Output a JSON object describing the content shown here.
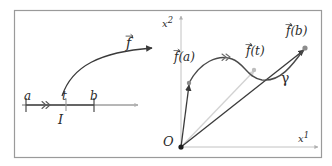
{
  "figure": {
    "frame": {
      "border_color": "#9a9a9a",
      "background": "#ffffff"
    },
    "colors": {
      "curve": "#3a3a3a",
      "axis": "#b9b9b9",
      "vector": "#3a3a3a",
      "faint_vector": "#cfcfcf",
      "point": "#8c8c8c",
      "text": "#2b2b2b"
    },
    "left_panel": {
      "name": "domain-interval",
      "interval_label": "I",
      "endpoint_left_label": "a",
      "interior_point_label": "t",
      "endpoint_right_label": "b",
      "map_label": "f",
      "map_label_has_vector_arrow": true,
      "number_line": {
        "y": 105,
        "x_start": 22,
        "x_end": 140,
        "ticks": [
          {
            "label": "a",
            "x": 26
          },
          {
            "label": "t",
            "x": 66
          },
          {
            "label": "b",
            "x": 94
          }
        ],
        "direction_marker_x": 46,
        "direction_marker_symbol": "double-chevron-right"
      }
    },
    "right_panel": {
      "name": "image-curve-plane",
      "axis_vertical_label": "x",
      "axis_vertical_sup": "2",
      "axis_horizontal_label": "x",
      "axis_horizontal_sup": "1",
      "origin_label": "O",
      "curve_label": "γ",
      "vectors": [
        {
          "name": "f-of-a",
          "label": "f(a)",
          "has_vector_arrow": true,
          "tip": [
            189,
            83
          ],
          "tail": [
            181,
            147
          ],
          "style": "solid-dark"
        },
        {
          "name": "f-of-t",
          "label": "f(t)",
          "has_vector_arrow": true,
          "tip": [
            254,
            70
          ],
          "tail": [
            181,
            147
          ],
          "style": "faint"
        },
        {
          "name": "f-of-b",
          "label": "f(b)",
          "has_vector_arrow": true,
          "tip": [
            305,
            48
          ],
          "tail": [
            181,
            147
          ],
          "style": "solid-dark"
        }
      ],
      "origin_point": [
        181,
        147
      ],
      "curve_direction_marker_symbol": "double-chevron-right"
    }
  }
}
